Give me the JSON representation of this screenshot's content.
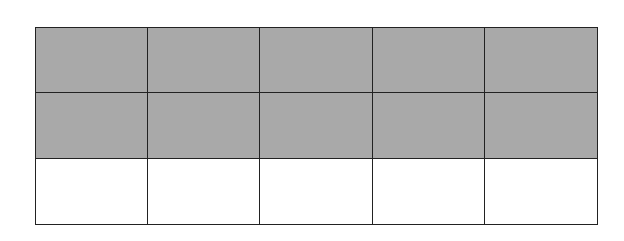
{
  "diagram": {
    "type": "fraction-grid",
    "rows": 3,
    "columns": 5,
    "total_cells": 15,
    "shaded_cells": 10,
    "shaded_fraction": "10/15",
    "shaded_rows": [
      0,
      1
    ],
    "colors": {
      "shaded": "#a9a9a9",
      "unshaded": "#ffffff",
      "border": "#222222"
    }
  }
}
